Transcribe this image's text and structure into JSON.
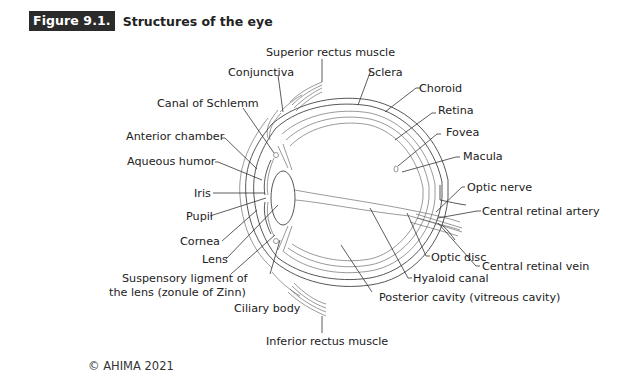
{
  "figure": {
    "number": "Figure 9.1.",
    "title": "Structures of the eye"
  },
  "labels": {
    "superior_rectus": "Superior rectus muscle",
    "conjunctiva": "Conjunctiva",
    "sclera": "Sclera",
    "choroid": "Choroid",
    "canal_schlemm": "Canal of Schlemm",
    "retina": "Retina",
    "fovea": "Fovea",
    "anterior_chamber": "Anterior chamber",
    "macula": "Macula",
    "aqueous_humor": "Aqueous humor",
    "optic_nerve": "Optic nerve",
    "iris": "Iris",
    "central_retinal_artery": "Central retinal artery",
    "pupil": "Pupil",
    "cornea": "Cornea",
    "lens": "Lens",
    "suspensory_1": "Suspensory ligment of",
    "suspensory_2": "the lens (zonule of Zinn)",
    "central_retinal_vein": "Central retinal vein",
    "optic_disc": "Optic disc",
    "ciliary_body": "Ciliary body",
    "hyaloid_canal": "Hyaloid canal",
    "posterior_cavity": "Posterior cavity (vitreous cavity)",
    "inferior_rectus": "Inferior rectus muscle"
  },
  "footer": {
    "copyright": "© AHIMA 2021"
  }
}
